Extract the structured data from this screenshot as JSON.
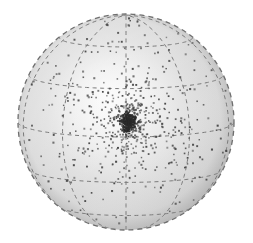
{
  "figure": {
    "domain": "scientific-illustration",
    "canvas": {
      "width": 253,
      "height": 243,
      "background": "#ffffff"
    }
  },
  "chart_data": {
    "type": "scatter",
    "title": "",
    "subtitle": "",
    "xlabel": "",
    "ylabel": "",
    "projection": "orthographic-sphere",
    "grid": true,
    "legend": null,
    "annotations": [],
    "sphere": {
      "center_x": 126,
      "center_y": 122,
      "radius": 108,
      "fill_light": "#fbfbfb",
      "fill_mid": "#d8d8d8",
      "fill_dark": "#a8a8a8",
      "outline_color": "#6e6e6e",
      "outline_dash": "5,4",
      "outline_width": 1.3,
      "highlight_x": 0.36,
      "highlight_y": 0.3
    },
    "graticule": {
      "color": "#7a7a7a",
      "dash": "4,3.5",
      "width": 1.0,
      "meridian_count": 5,
      "latitude_count": 4,
      "meridian_longitudes": [
        -72,
        -36,
        0,
        36,
        72
      ],
      "latitude_values": [
        -52,
        -26,
        0,
        26,
        52
      ],
      "tilt_deg": 8
    },
    "points": {
      "count": 920,
      "color": "#4a4a4a",
      "core_color": "#2b2b2b",
      "size_min": 1.0,
      "size_max": 2.1,
      "cluster_center_x": 128,
      "cluster_center_y": 122,
      "cluster_core_radius": 7,
      "radial_concentration": 2.6,
      "seed": 20240517
    },
    "series": [
      {
        "name": "sampled points",
        "marker": "dot",
        "color": "#4a4a4a",
        "n": 920,
        "distribution": "radially-concentrated-on-sphere"
      }
    ]
  }
}
